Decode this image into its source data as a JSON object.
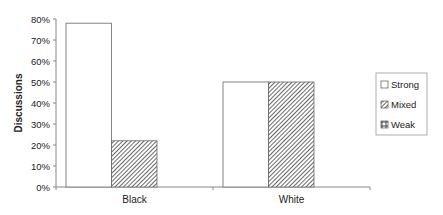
{
  "chart_data": {
    "type": "bar",
    "title": "",
    "xlabel": "",
    "ylabel": "Discussions",
    "ylim": [
      0,
      80
    ],
    "yticks": [
      "0%",
      "10%",
      "20%",
      "30%",
      "40%",
      "50%",
      "60%",
      "70%",
      "80%"
    ],
    "categories": [
      "Black",
      "White"
    ],
    "series": [
      {
        "name": "Strong",
        "pattern": "none",
        "values": [
          78,
          50
        ]
      },
      {
        "name": "Mixed",
        "pattern": "diagonal-hatch",
        "values": [
          22,
          50
        ]
      },
      {
        "name": "Weak",
        "pattern": "grid",
        "values": [
          0,
          0
        ]
      }
    ],
    "grid": false,
    "legend_position": "right"
  },
  "colors": {
    "axis": "#888888",
    "bar_border": "#666666",
    "text": "#222222"
  }
}
